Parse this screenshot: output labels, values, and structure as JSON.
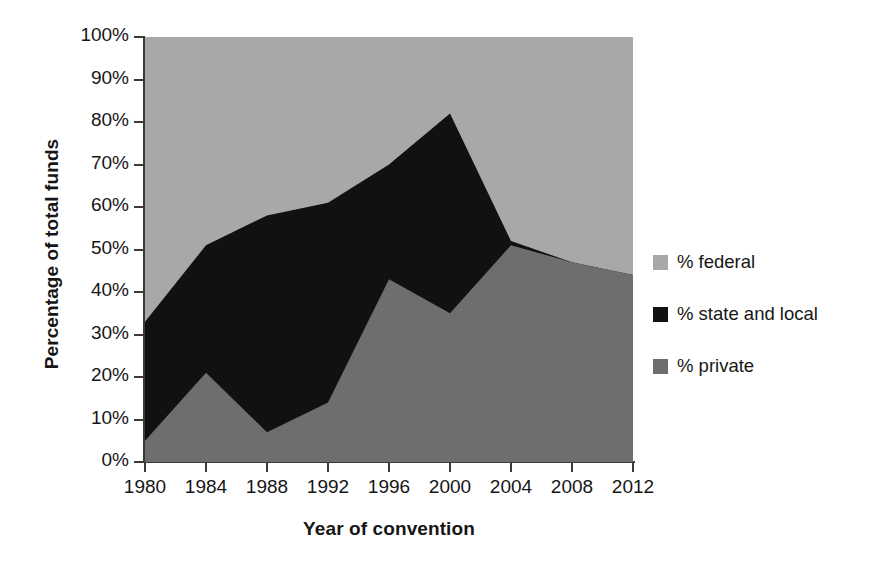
{
  "chart_data": {
    "type": "area",
    "stacked": true,
    "title": "",
    "subtitle": "",
    "xlabel": "Year of convention",
    "ylabel": "Percentage of total funds",
    "categories": [
      1980,
      1984,
      1988,
      1992,
      1996,
      2000,
      2004,
      2008,
      2012
    ],
    "x_tick_labels": [
      "1980",
      "1984",
      "1988",
      "1992",
      "1996",
      "2000",
      "2004",
      "2008",
      "2012"
    ],
    "y_tick_labels": [
      "0%",
      "10%",
      "20%",
      "30%",
      "40%",
      "50%",
      "60%",
      "70%",
      "80%",
      "90%",
      "100%"
    ],
    "y_tick_values": [
      0,
      10,
      20,
      30,
      40,
      50,
      60,
      70,
      80,
      90,
      100
    ],
    "xlim": [
      1980,
      2012
    ],
    "ylim": [
      0,
      100
    ],
    "grid": false,
    "legend_position": "right",
    "series": [
      {
        "name": "% private",
        "color": "#6e6e6e",
        "values": [
          5,
          21,
          7,
          14,
          43,
          35,
          51,
          47,
          44
        ]
      },
      {
        "name": "% state and local",
        "color": "#111111",
        "values": [
          28,
          30,
          51,
          47,
          27,
          47,
          1,
          0,
          0
        ]
      },
      {
        "name": "% federal",
        "color": "#a8a8a8",
        "values": [
          67,
          49,
          42,
          39,
          30,
          18,
          48,
          53,
          56
        ]
      }
    ],
    "cumulative_boundaries": {
      "private_top": [
        5,
        21,
        7,
        14,
        43,
        35,
        51,
        47,
        44
      ],
      "state_and_local_top": [
        33,
        51,
        58,
        61,
        70,
        82,
        52,
        47,
        44
      ]
    },
    "legend_order_displayed": [
      "% federal",
      "% state and local",
      "% private"
    ]
  },
  "legend": {
    "items": [
      {
        "label": "% federal",
        "color": "#a8a8a8",
        "swatch": "legend-swatch-federal"
      },
      {
        "label": "% state and local",
        "color": "#111111",
        "swatch": "legend-swatch-state-local"
      },
      {
        "label": "% private",
        "color": "#6e6e6e",
        "swatch": "legend-swatch-private"
      }
    ]
  },
  "axes": {
    "y_title": "Percentage of total funds",
    "x_title": "Year of convention"
  }
}
